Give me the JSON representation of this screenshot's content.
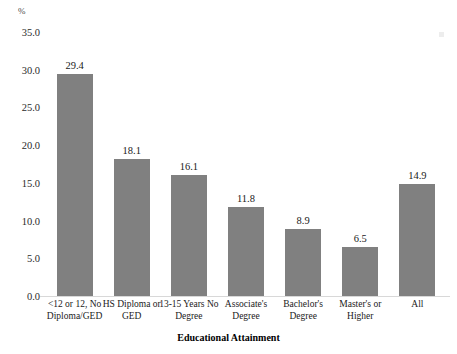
{
  "chart_data": {
    "type": "bar",
    "title": "",
    "subtitle": "",
    "xlabel": "Educational Attainment",
    "ylabel": "%",
    "ylim": [
      0.0,
      35.0
    ],
    "ytick_step": 5.0,
    "grid": false,
    "legend": null,
    "bar_color": "#808080",
    "categories": [
      "<12 or 12, No Diploma/GED",
      "HS Diploma or GED",
      "13-15 Years No Degree",
      "Associate's Degree",
      "Bachelor's Degree",
      "Master's or Higher",
      "All"
    ],
    "category_lines": [
      [
        "<12 or 12, No",
        "Diploma/GED"
      ],
      [
        "HS Diploma or",
        "GED"
      ],
      [
        "13-15 Years No",
        "Degree"
      ],
      [
        "Associate's",
        "Degree"
      ],
      [
        "Bachelor's",
        "Degree"
      ],
      [
        "Master's or",
        "Higher"
      ],
      [
        "All"
      ]
    ],
    "values": [
      29.4,
      18.1,
      16.1,
      11.8,
      8.9,
      6.5,
      14.9
    ],
    "value_labels": [
      "29.4",
      "18.1",
      "16.1",
      "11.8",
      "8.9",
      "6.5",
      "14.9"
    ],
    "ytick_labels": [
      "35.0",
      "30.0",
      "25.0",
      "20.0",
      "15.0",
      "10.0",
      "5.0",
      "0.0"
    ],
    "ytick_values": [
      35.0,
      30.0,
      25.0,
      20.0,
      15.0,
      10.0,
      5.0,
      0.0
    ]
  }
}
